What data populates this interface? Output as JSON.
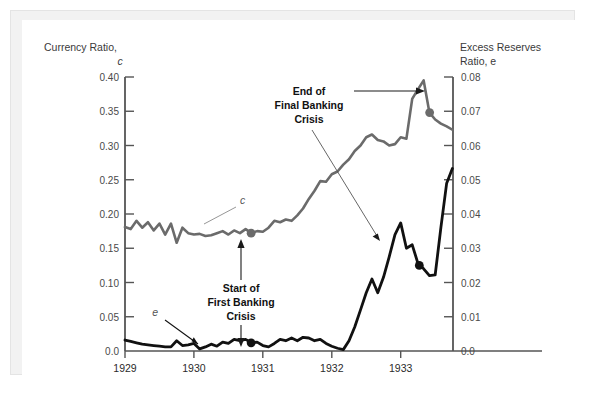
{
  "figure": {
    "background_color": "#ffffff",
    "mat_color": "#f2f2f2",
    "panel_color": "#ffffff"
  },
  "axes": {
    "left_title_line1": "Currency Ratio,",
    "left_title_line2": "c",
    "right_title_line1": "Excess Reserves",
    "right_title_line2": "Ratio, e"
  },
  "annotations": {
    "end_crisis_line1": "End of",
    "end_crisis_line2": "Final Banking",
    "end_crisis_line3": "Crisis",
    "start_crisis_line1": "Start of",
    "start_crisis_line2": "First Banking",
    "start_crisis_line3": "Crisis",
    "label_c": "c",
    "label_e": "e"
  },
  "colors": {
    "currency_ratio_line": "#6b6b6b",
    "excess_reserves_line": "#111111",
    "axis": "#555555",
    "text": "#2b2b2b"
  },
  "chart_data": {
    "type": "line",
    "title": "",
    "subtitle": "",
    "xlabel": "",
    "ylabel": "Currency Ratio, c",
    "y2label": "Excess Reserves Ratio, e",
    "grid": false,
    "legend_position": "inline-labels",
    "xlim": [
      1929.0,
      1933.75
    ],
    "ylim": [
      0.0,
      0.4
    ],
    "y2lim": [
      0.0,
      0.08
    ],
    "xticks": [
      "1929",
      "1930",
      "1931",
      "1932",
      "1933"
    ],
    "xtick_values": [
      1929,
      1930,
      1931,
      1932,
      1933
    ],
    "yticks_left": [
      "0.0",
      "0.05",
      "0.10",
      "0.15",
      "0.20",
      "0.25",
      "0.30",
      "0.35",
      "0.40"
    ],
    "ytick_values_left": [
      0.0,
      0.05,
      0.1,
      0.15,
      0.2,
      0.25,
      0.3,
      0.35,
      0.4
    ],
    "yticks_right": [
      "0.0",
      "0.01",
      "0.02",
      "0.03",
      "0.04",
      "0.05",
      "0.06",
      "0.07",
      "0.08"
    ],
    "ytick_values_right": [
      0.0,
      0.01,
      0.02,
      0.03,
      0.04,
      0.05,
      0.06,
      0.07,
      0.08
    ],
    "series": [
      {
        "name": "c",
        "label": "Currency Ratio, c",
        "axis": "left",
        "color": "#6b6b6b",
        "x": [
          1929.0,
          1929.083,
          1929.167,
          1929.25,
          1929.333,
          1929.417,
          1929.5,
          1929.583,
          1929.667,
          1929.75,
          1929.833,
          1929.917,
          1930.0,
          1930.083,
          1930.167,
          1930.25,
          1930.333,
          1930.417,
          1930.5,
          1930.583,
          1930.667,
          1930.75,
          1930.833,
          1930.917,
          1931.0,
          1931.083,
          1931.167,
          1931.25,
          1931.333,
          1931.417,
          1931.5,
          1931.583,
          1931.667,
          1931.75,
          1931.833,
          1931.917,
          1932.0,
          1932.083,
          1932.167,
          1932.25,
          1932.333,
          1932.417,
          1932.5,
          1932.583,
          1932.667,
          1932.75,
          1932.833,
          1932.917,
          1933.0,
          1933.083,
          1933.167,
          1933.25,
          1933.333,
          1933.417,
          1933.5,
          1933.583,
          1933.667,
          1933.75
        ],
        "values": [
          0.181,
          0.178,
          0.19,
          0.18,
          0.188,
          0.176,
          0.186,
          0.17,
          0.186,
          0.158,
          0.18,
          0.172,
          0.17,
          0.171,
          0.168,
          0.169,
          0.172,
          0.175,
          0.17,
          0.176,
          0.172,
          0.178,
          0.172,
          0.175,
          0.174,
          0.18,
          0.19,
          0.188,
          0.192,
          0.19,
          0.198,
          0.208,
          0.222,
          0.234,
          0.248,
          0.247,
          0.258,
          0.262,
          0.272,
          0.28,
          0.292,
          0.3,
          0.312,
          0.316,
          0.308,
          0.306,
          0.3,
          0.302,
          0.312,
          0.31,
          0.368,
          0.382,
          0.395,
          0.348,
          0.338,
          0.332,
          0.328,
          0.323
        ]
      },
      {
        "name": "e",
        "label": "Excess Reserves Ratio, e",
        "axis": "right",
        "color": "#111111",
        "x": [
          1929.0,
          1929.083,
          1929.167,
          1929.25,
          1929.333,
          1929.417,
          1929.5,
          1929.583,
          1929.667,
          1929.75,
          1929.833,
          1929.917,
          1930.0,
          1930.083,
          1930.167,
          1930.25,
          1930.333,
          1930.417,
          1930.5,
          1930.583,
          1930.667,
          1930.75,
          1930.833,
          1930.917,
          1931.0,
          1931.083,
          1931.167,
          1931.25,
          1931.333,
          1931.417,
          1931.5,
          1931.583,
          1931.667,
          1931.75,
          1931.833,
          1931.917,
          1932.0,
          1932.083,
          1932.167,
          1932.25,
          1932.333,
          1932.417,
          1932.5,
          1932.583,
          1932.667,
          1932.75,
          1932.833,
          1932.917,
          1933.0,
          1933.083,
          1933.167,
          1933.25,
          1933.333,
          1933.417,
          1933.5,
          1933.583,
          1933.667,
          1933.75
        ],
        "values": [
          0.0032,
          0.0028,
          0.0024,
          0.002,
          0.0018,
          0.0016,
          0.0014,
          0.0012,
          0.0012,
          0.003,
          0.0016,
          0.0018,
          0.0022,
          0.0006,
          0.0012,
          0.002,
          0.0014,
          0.0026,
          0.0022,
          0.0034,
          0.003,
          0.0034,
          0.0024,
          0.0026,
          0.0016,
          0.0012,
          0.0022,
          0.0034,
          0.003,
          0.0038,
          0.003,
          0.004,
          0.0038,
          0.003,
          0.0034,
          0.0022,
          0.0014,
          0.0008,
          0.0004,
          0.003,
          0.007,
          0.012,
          0.017,
          0.021,
          0.017,
          0.0215,
          0.0275,
          0.034,
          0.0374,
          0.03,
          0.031,
          0.0256,
          0.024,
          0.022,
          0.0222,
          0.036,
          0.049,
          0.0533
        ]
      }
    ],
    "markers": [
      {
        "name": "start-first-banking-crisis-c",
        "series": "c",
        "x": 1930.83,
        "value": 0.172,
        "color": "#6b6b6b",
        "label": "Start of First Banking Crisis"
      },
      {
        "name": "start-first-banking-crisis-e",
        "series": "e",
        "x": 1930.83,
        "value": 0.0024,
        "color": "#111111",
        "label": "Start of First Banking Crisis"
      },
      {
        "name": "end-final-banking-crisis-c",
        "series": "c",
        "x": 1933.42,
        "value": 0.348,
        "color": "#6b6b6b",
        "label": "End of Final Banking Crisis"
      },
      {
        "name": "end-final-banking-crisis-e",
        "series": "e",
        "x": 1933.27,
        "value": 0.025,
        "color": "#111111",
        "label": "End of Final Banking Crisis"
      }
    ]
  }
}
